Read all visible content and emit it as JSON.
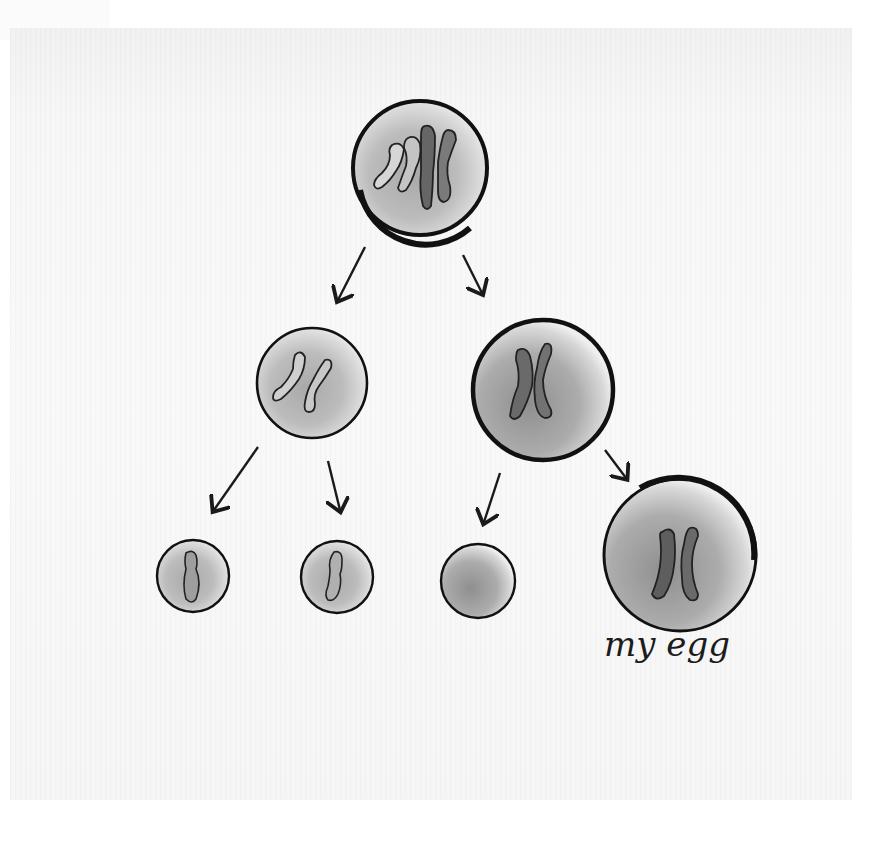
{
  "illustration": {
    "subject": "cell division producing an egg",
    "palette": {
      "paper": "#f7f7f7",
      "ink": "#141414",
      "cytoplasm_light": "#d2d2d2",
      "cytoplasm_dark": "#9a9a9a",
      "chromosome_dark": "#5a5a5a",
      "chromosome_light": "#bdbdbd"
    },
    "cells": [
      {
        "id": "parent-cell",
        "level": 0,
        "chromosomes": 4
      },
      {
        "id": "daughter-cell-left",
        "level": 1,
        "chromosomes": 2
      },
      {
        "id": "daughter-cell-right",
        "level": 1,
        "chromosomes": 2
      },
      {
        "id": "polar-body-1",
        "level": 2,
        "chromosomes": 1
      },
      {
        "id": "polar-body-2",
        "level": 2,
        "chromosomes": 1
      },
      {
        "id": "polar-body-3",
        "level": 2,
        "chromosomes": 0
      },
      {
        "id": "egg-cell",
        "level": 2,
        "chromosomes": 2
      }
    ],
    "label": "my egg"
  }
}
